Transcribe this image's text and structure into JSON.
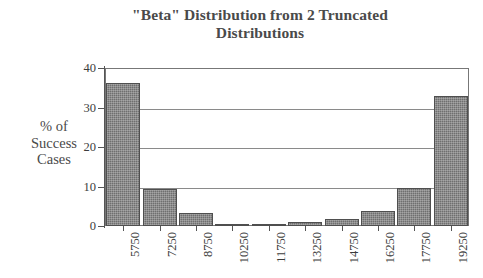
{
  "chart_data": {
    "type": "bar",
    "title": "\"Beta\" Distribution from 2 Truncated Distributions",
    "title_line1": "\"Beta\" Distribution from 2 Truncated",
    "title_line2": "Distributions",
    "xlabel": "",
    "ylabel": "% of Success Cases",
    "ylabel_lines": [
      "% of",
      "Success",
      "Cases"
    ],
    "categories": [
      "5750",
      "7250",
      "8750",
      "10250",
      "11750",
      "13250",
      "14750",
      "16250",
      "17750",
      "19250"
    ],
    "values": [
      36.2,
      9.4,
      3.4,
      0.5,
      0.6,
      0.9,
      1.8,
      3.7,
      9.7,
      33.0
    ],
    "ylim": [
      0,
      40
    ],
    "yticks": [
      0,
      10,
      20,
      30,
      40
    ],
    "ytick_labels": [
      "0",
      "10",
      "20",
      "30",
      "40"
    ],
    "grid": true,
    "grid_axis": "y",
    "legend": false,
    "bar_color": "#6f6f6f",
    "bar_edge_color": "#4f4f4f",
    "axis_color": "#555555",
    "background": "#ffffff",
    "x_tick_label_rotation": -90
  }
}
